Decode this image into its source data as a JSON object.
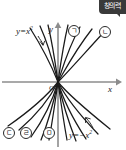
{
  "badge": {
    "text": "창의력",
    "bg": "#3a3a3a",
    "fg": "#ffffff"
  },
  "figure": {
    "axis_labels": {
      "x": "x",
      "y": "y",
      "origin": "O"
    },
    "curve_labels": [
      {
        "id": "upper-parabola-label",
        "text_html": "y=x<sup>2</sup>",
        "plain": "y=x2",
        "x": 16,
        "y": 26
      },
      {
        "id": "lower-parabola-label",
        "text_html": "y=−x<sup>2</sup>",
        "plain": "y=-x2",
        "x": 69,
        "y": 130
      }
    ],
    "markers": [
      {
        "name": "marker-giyeok",
        "label": "ㄱ",
        "x": 68,
        "y": 25,
        "region": "upper-right"
      },
      {
        "name": "marker-nieun",
        "label": "ㄴ",
        "x": 99,
        "y": 26,
        "region": "upper-right-outer"
      },
      {
        "name": "marker-digeut",
        "label": "ㄷ",
        "x": 3,
        "y": 127,
        "region": "lower-left-outer"
      },
      {
        "name": "marker-rieul",
        "label": "ㄹ",
        "x": 20,
        "y": 127,
        "region": "lower-left"
      },
      {
        "name": "marker-mieum",
        "label": "ㅁ",
        "x": 43,
        "y": 127,
        "region": "lower-left-inner"
      }
    ],
    "colors": {
      "curve": "#1a1a1a",
      "axis": "#8c8c8c",
      "background": "#ffffff"
    }
  },
  "chart_data": {
    "type": "line",
    "title": "",
    "xlabel": "x",
    "ylabel": "y",
    "xlim": [
      -3.4,
      3.4
    ],
    "ylim": [
      -3.0,
      3.0
    ],
    "grid": false,
    "legend": "none",
    "series": [
      {
        "name": "a = 4.0",
        "a": 4.0,
        "direction": "up",
        "side": "left"
      },
      {
        "name": "a = 1.6",
        "a": 1.6,
        "direction": "up",
        "side": "left"
      },
      {
        "name": "a = 1.0",
        "a": 1.0,
        "direction": "up",
        "side": "left",
        "labelled": "y=x2"
      },
      {
        "name": "a = 1.0r",
        "a": 1.0,
        "direction": "up",
        "side": "right"
      },
      {
        "name": "a = 0.55",
        "a": 0.55,
        "direction": "up",
        "side": "right",
        "marker": "ㄱ"
      },
      {
        "name": "a = 0.30",
        "a": 0.3,
        "direction": "up",
        "side": "right",
        "marker": "ㄴ"
      },
      {
        "name": "a = -0.30",
        "a": -0.3,
        "direction": "down",
        "side": "left",
        "marker": "ㄷ"
      },
      {
        "name": "a = -0.50",
        "a": -0.5,
        "direction": "down",
        "side": "left",
        "marker": "ㄹ"
      },
      {
        "name": "a = -1.0",
        "a": -1.0,
        "direction": "down",
        "side": "left",
        "marker": "ㅁ"
      },
      {
        "name": "a = -2.2",
        "a": -2.2,
        "direction": "down",
        "side": "left"
      },
      {
        "name": "a = -2.2r",
        "a": -2.2,
        "direction": "down",
        "side": "right"
      },
      {
        "name": "a = -1.0r",
        "a": -1.0,
        "direction": "down",
        "side": "right"
      },
      {
        "name": "a = -0.5r",
        "a": -0.5,
        "direction": "down",
        "side": "right",
        "labelled": "y=-x2"
      },
      {
        "name": "a = -0.3r",
        "a": -0.3,
        "direction": "down",
        "side": "right"
      }
    ],
    "annotations": [
      {
        "text": "y=x2",
        "points_to": "upper-left-inner-curve"
      },
      {
        "text": "y=-x2",
        "points_to": "lower-right-curve"
      }
    ]
  }
}
